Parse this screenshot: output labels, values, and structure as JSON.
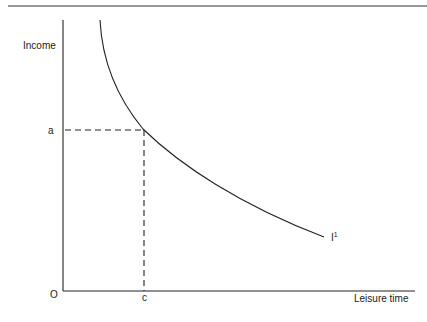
{
  "diagram": {
    "type": "indifference-curve",
    "axes": {
      "y_label": "Income",
      "x_label": "Leisure time",
      "origin_label": "O"
    },
    "markers": {
      "y_marker": "a",
      "x_marker": "c"
    },
    "curve": {
      "label_main": "I",
      "label_sup": "1"
    },
    "colors": {
      "line": "#222222",
      "background": "#ffffff"
    }
  }
}
